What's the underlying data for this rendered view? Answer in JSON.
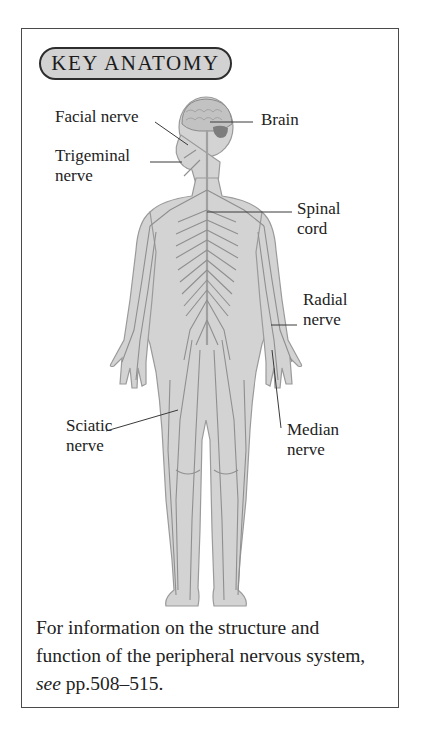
{
  "header": {
    "title": "KEY ANATOMY"
  },
  "figure": {
    "labels": {
      "facial_nerve": "Facial nerve",
      "brain": "Brain",
      "trigeminal_nerve": "Trigeminal\nnerve",
      "spinal_cord": "Spinal\ncord",
      "radial_nerve": "Radial\nnerve",
      "sciatic_nerve": "Sciatic\nnerve",
      "median_nerve": "Median\nnerve"
    }
  },
  "caption": {
    "text_before": "For information on the structure and function of the peripheral nervous system, ",
    "see": "see",
    "text_after": " pp.508–515."
  },
  "colors": {
    "body_fill": "#d3d3d3",
    "nerve_stroke": "#8f8f8f",
    "pill_fill": "#d2d2d2",
    "border": "#4a4a4a"
  }
}
